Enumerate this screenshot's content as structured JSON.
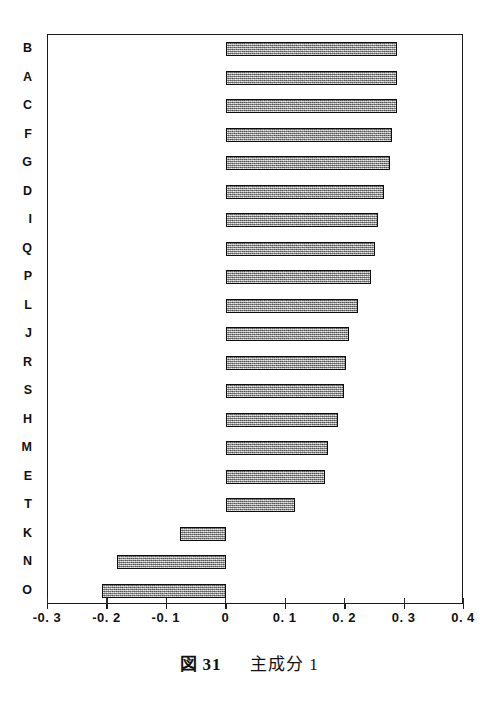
{
  "caption": {
    "figure_word": "図",
    "figure_number": "31",
    "title": "主成分 1"
  },
  "chart_data": {
    "type": "bar",
    "orientation": "horizontal",
    "xlabel": "",
    "ylabel": "",
    "xlim": [
      -0.3,
      0.4
    ],
    "xticks": [
      -0.3,
      -0.2,
      -0.1,
      0,
      0.1,
      0.2,
      0.3,
      0.4
    ],
    "xticklabels": [
      "-0. 3",
      "-0. 2",
      "-0. 1",
      "0",
      "0. 1",
      "0. 2",
      "0. 3",
      "0. 4"
    ],
    "grid": false,
    "legend": null,
    "bar_fill": "#a2a2a2",
    "bar_edge": "#0d0d0d",
    "categories": [
      "B",
      "A",
      "C",
      "F",
      "G",
      "D",
      "I",
      "Q",
      "P",
      "L",
      "J",
      "R",
      "S",
      "H",
      "M",
      "E",
      "T",
      "K",
      "N",
      "O"
    ],
    "values": [
      0.288,
      0.288,
      0.287,
      0.279,
      0.276,
      0.265,
      0.256,
      0.251,
      0.244,
      0.222,
      0.206,
      0.202,
      0.198,
      0.188,
      0.172,
      0.166,
      0.116,
      -0.078,
      -0.184,
      -0.209
    ]
  }
}
